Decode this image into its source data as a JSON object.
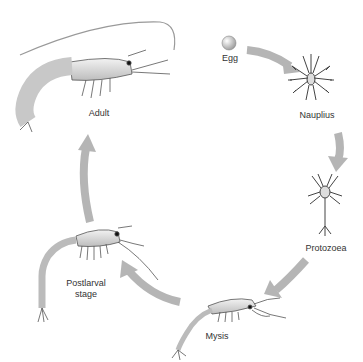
{
  "diagram": {
    "arrow_color": "#b5b5b5",
    "stages": [
      {
        "id": "egg",
        "label": "Egg"
      },
      {
        "id": "nauplius",
        "label": "Nauplius"
      },
      {
        "id": "protozoea",
        "label": "Protozoea"
      },
      {
        "id": "mysis",
        "label": "Mysis"
      },
      {
        "id": "postlarval",
        "label": "Postlarval\nstage",
        "line1": "Postlarval",
        "line2": "stage"
      },
      {
        "id": "adult",
        "label": "Adult"
      }
    ],
    "arrows": [
      {
        "from": "egg",
        "to": "nauplius"
      },
      {
        "from": "nauplius",
        "to": "protozoea"
      },
      {
        "from": "protozoea",
        "to": "mysis"
      },
      {
        "from": "mysis",
        "to": "postlarval"
      },
      {
        "from": "postlarval",
        "to": "adult"
      }
    ]
  }
}
